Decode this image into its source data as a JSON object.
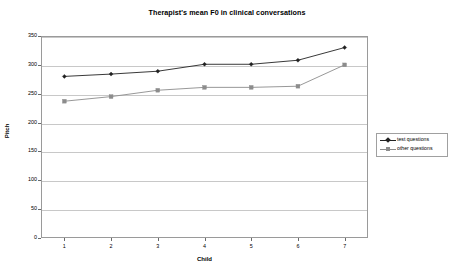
{
  "chart_data": {
    "type": "line",
    "title": "Therapist's mean F0 in clinical conversations",
    "xlabel": "Child",
    "ylabel": "Pitch",
    "x": [
      1,
      2,
      3,
      4,
      5,
      6,
      7
    ],
    "categories": [
      "1",
      "2",
      "3",
      "4",
      "5",
      "6",
      "7"
    ],
    "xlim": [
      0.5,
      7.5
    ],
    "ylim": [
      0,
      350
    ],
    "yticks": [
      0,
      50,
      100,
      150,
      200,
      250,
      300,
      350
    ],
    "ytick_labels": [
      "0",
      "50",
      "100",
      "150",
      "200",
      "250",
      "300",
      "350"
    ],
    "grid": "horizontal",
    "legend_position": "right",
    "series": [
      {
        "name": "test questions",
        "values": [
          280,
          284,
          289,
          301,
          301,
          308,
          330
        ],
        "color": "#222222",
        "marker": "diamond"
      },
      {
        "name": "other questions",
        "values": [
          237,
          245,
          256,
          261,
          261,
          263,
          300
        ],
        "color": "#8c8c8c",
        "marker": "square"
      }
    ]
  },
  "legend": {
    "entries": [
      {
        "label": "test questions"
      },
      {
        "label": "other questions"
      }
    ]
  }
}
